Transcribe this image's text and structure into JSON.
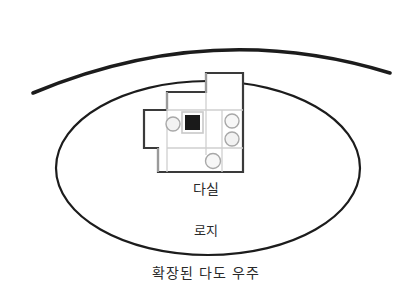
{
  "diagram": {
    "type": "hand-drawn-conceptual-diagram",
    "caption": "확장된 다도 우주",
    "labels": {
      "tearoom": "다실",
      "roji": "로지"
    },
    "colors": {
      "ink": "#1c1c1c",
      "plan_outline": "#3a3a3a",
      "plan_inner_line": "#cfcfcf",
      "hearth_fill": "#1a1a1a",
      "hearth_frame": "#c9c9c9",
      "circle_stroke": "#a8a8a8",
      "circle_fill": "#f2f2f2",
      "background": "#ffffff",
      "text": "#2a2a2a"
    },
    "shapes": {
      "outer_arc": {
        "name": "outer-arc",
        "description": "thick open arc over the oval",
        "start": [
          33,
          93
        ],
        "control": [
          212,
          18
        ],
        "end": [
          390,
          73
        ],
        "stroke_width": 3.6
      },
      "oval": {
        "name": "roji-oval",
        "description": "hand-drawn oval enclosure",
        "cx": 208,
        "cy": 168,
        "rx": 152,
        "ry": 87,
        "stroke_width": 2.2
      },
      "plan": {
        "name": "tearoom-floor-plan",
        "outline_points": "206,73 243,73 243,172 158,172 158,148 144,148 144,110 167,110 167,92 206,92",
        "stroke_width": 2.2,
        "inner_lines": [
          {
            "x1": 167,
            "y1": 110,
            "x2": 243,
            "y2": 110
          },
          {
            "x1": 167,
            "y1": 92,
            "x2": 167,
            "y2": 172
          },
          {
            "x1": 206,
            "y1": 73,
            "x2": 206,
            "y2": 155
          },
          {
            "x1": 167,
            "y1": 148,
            "x2": 243,
            "y2": 148
          },
          {
            "x1": 222,
            "y1": 110,
            "x2": 222,
            "y2": 172
          },
          {
            "x1": 158,
            "y1": 148,
            "x2": 158,
            "y2": 172
          }
        ],
        "hearth": {
          "name": "hearth-square",
          "x": 185,
          "y": 115,
          "w": 15,
          "h": 15,
          "frame_pad": 3
        },
        "circles": [
          {
            "name": "plan-circle-left",
            "cx": 173,
            "cy": 124,
            "r": 7
          },
          {
            "name": "plan-circle-right-upper",
            "cx": 232,
            "cy": 121,
            "r": 7
          },
          {
            "name": "plan-circle-right-lower",
            "cx": 232,
            "cy": 139,
            "r": 7
          },
          {
            "name": "plan-circle-bottom",
            "cx": 213,
            "cy": 161,
            "r": 7.5
          }
        ]
      }
    }
  }
}
